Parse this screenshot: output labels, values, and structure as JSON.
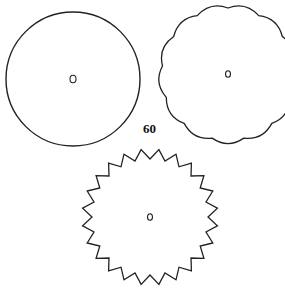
{
  "figure": {
    "label": "60",
    "shapes": [
      {
        "name": "plain-circle",
        "type": "circle",
        "center": [
          73,
          79
        ],
        "radius": 67,
        "hole_radius": 3
      },
      {
        "name": "scalloped-circle",
        "type": "scalloped",
        "center": [
          228,
          74
        ],
        "radius": 66,
        "scallops": 13,
        "hole_radius": 2.5
      },
      {
        "name": "gear-circle",
        "type": "sawtooth",
        "center": [
          150,
          217
        ],
        "radius": 68,
        "teeth": 24,
        "tooth_depth": 10,
        "hole_radius": 2.5
      }
    ],
    "stroke_color": "#222222"
  }
}
